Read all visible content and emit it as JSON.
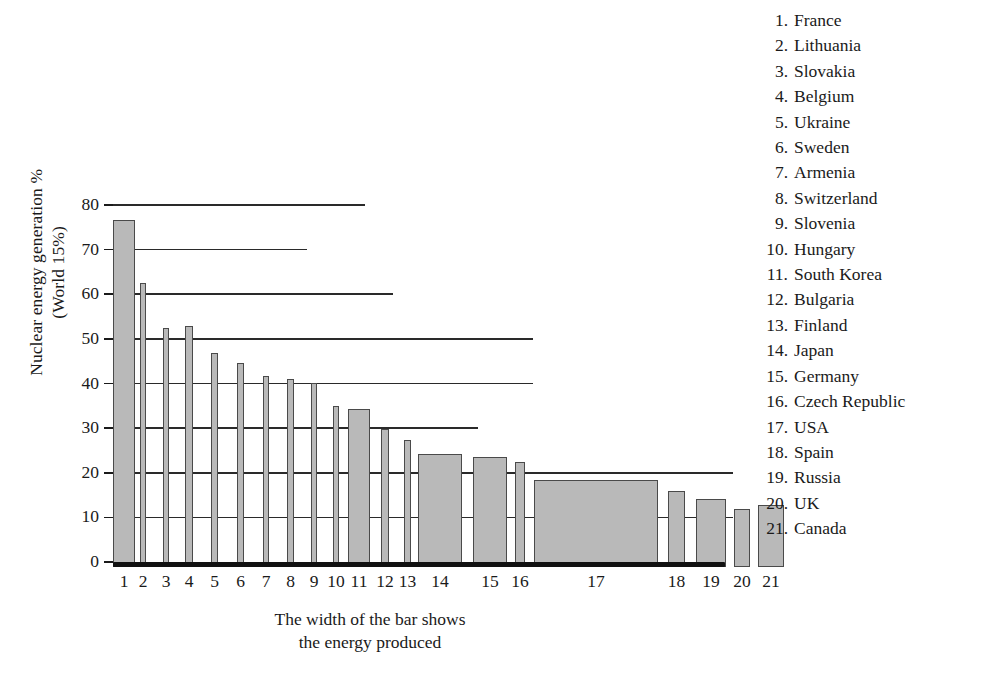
{
  "chart_data": {
    "type": "bar",
    "title": "",
    "ylabel": "Nuclear energy generation %\n(World 15%)",
    "xlabel": "The width of the bar shows\nthe energy produced",
    "ylim": [
      0,
      80
    ],
    "yticks": [
      0,
      10,
      20,
      30,
      40,
      50,
      60,
      70,
      80
    ],
    "grid": "horizontal-partial",
    "legend_position": "right",
    "bar_fill_color": "#b9b9b9",
    "bar_edge_color": "#4a4a4a",
    "note": "Bar width encodes total energy produced; bar height encodes nuclear share of generation.",
    "categories": [
      "1",
      "2",
      "3",
      "4",
      "5",
      "6",
      "7",
      "8",
      "9",
      "10",
      "11",
      "12",
      "13",
      "14",
      "15",
      "16",
      "17",
      "18",
      "19",
      "20",
      "21"
    ],
    "points": [
      {
        "rank": 1,
        "country": "France",
        "value": 77.7,
        "x0": 0,
        "x1": 22
      },
      {
        "rank": 2,
        "country": "Lithuania",
        "value": 63.6,
        "x0": 27,
        "x1": 33
      },
      {
        "rank": 3,
        "country": "Slovakia",
        "value": 53.5,
        "x0": 50,
        "x1": 56
      },
      {
        "rank": 4,
        "country": "Belgium",
        "value": 54.1,
        "x0": 72,
        "x1": 80
      },
      {
        "rank": 5,
        "country": "Ukraine",
        "value": 47.9,
        "x0": 98,
        "x1": 105
      },
      {
        "rank": 6,
        "country": "Sweden",
        "value": 45.7,
        "x0": 124,
        "x1": 131
      },
      {
        "rank": 7,
        "country": "Armenia",
        "value": 42.7,
        "x0": 150,
        "x1": 156
      },
      {
        "rank": 8,
        "country": "Switzerland",
        "value": 42.1,
        "x0": 174,
        "x1": 181
      },
      {
        "rank": 9,
        "country": "Slovenia",
        "value": 41.2,
        "x0": 198,
        "x1": 204
      },
      {
        "rank": 10,
        "country": "Hungary",
        "value": 36.1,
        "x0": 220,
        "x1": 226
      },
      {
        "rank": 11,
        "country": "South Korea",
        "value": 35.3,
        "x0": 235,
        "x1": 257
      },
      {
        "rank": 12,
        "country": "Bulgaria",
        "value": 30.9,
        "x0": 268,
        "x1": 276
      },
      {
        "rank": 13,
        "country": "Finland",
        "value": 28.5,
        "x0": 291,
        "x1": 298
      },
      {
        "rank": 14,
        "country": "Japan",
        "value": 25.4,
        "x0": 305,
        "x1": 349
      },
      {
        "rank": 15,
        "country": "Germany",
        "value": 24.6,
        "x0": 360,
        "x1": 394
      },
      {
        "rank": 16,
        "country": "Czech Republic",
        "value": 23.5,
        "x0": 402,
        "x1": 412
      },
      {
        "rank": 17,
        "country": "USA",
        "value": 19.4,
        "x0": 421,
        "x1": 545
      },
      {
        "rank": 18,
        "country": "Spain",
        "value": 17.0,
        "x0": 555,
        "x1": 572
      },
      {
        "rank": 19,
        "country": "Russia",
        "value": 15.2,
        "x0": 583,
        "x1": 613
      },
      {
        "rank": 20,
        "country": "UK",
        "value": 13.1,
        "x0": 621,
        "x1": 637
      },
      {
        "rank": 21,
        "country": "Canada",
        "value": 13.8,
        "x0": 645,
        "x1": 671
      }
    ],
    "gridlines": [
      {
        "value": 80,
        "extent": 252
      },
      {
        "value": 70,
        "extent": 194
      },
      {
        "value": 60,
        "extent": 280
      },
      {
        "value": 50,
        "extent": 420
      },
      {
        "value": 40,
        "extent": 420
      },
      {
        "value": 30,
        "extent": 365
      },
      {
        "value": 20,
        "extent": 620
      },
      {
        "value": 10,
        "extent": 620
      }
    ]
  },
  "legend": {
    "items": [
      {
        "num": "1.",
        "name": "France"
      },
      {
        "num": "2.",
        "name": "Lithuania"
      },
      {
        "num": "3.",
        "name": "Slovakia"
      },
      {
        "num": "4.",
        "name": "Belgium"
      },
      {
        "num": "5.",
        "name": "Ukraine"
      },
      {
        "num": "6.",
        "name": "Sweden"
      },
      {
        "num": "7.",
        "name": "Armenia"
      },
      {
        "num": "8.",
        "name": "Switzerland"
      },
      {
        "num": "9.",
        "name": "Slovenia"
      },
      {
        "num": "10.",
        "name": "Hungary"
      },
      {
        "num": "11.",
        "name": "South Korea"
      },
      {
        "num": "12.",
        "name": "Bulgaria"
      },
      {
        "num": "13.",
        "name": "Finland"
      },
      {
        "num": "14.",
        "name": "Japan"
      },
      {
        "num": "15.",
        "name": "Germany"
      },
      {
        "num": "16.",
        "name": "Czech Republic"
      },
      {
        "num": "17.",
        "name": "USA"
      },
      {
        "num": "18.",
        "name": "Spain"
      },
      {
        "num": "19.",
        "name": "Russia"
      },
      {
        "num": "20.",
        "name": "UK"
      },
      {
        "num": "21.",
        "name": "Canada"
      }
    ]
  }
}
